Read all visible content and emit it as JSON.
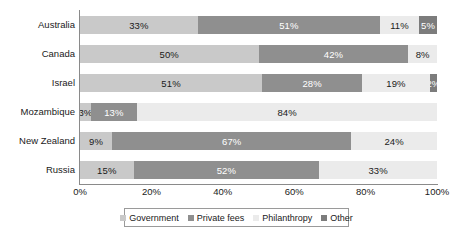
{
  "chart_data": {
    "type": "bar",
    "orientation": "horizontal",
    "stacked": true,
    "normalized": true,
    "title": "",
    "subtitle": "",
    "xlabel": "",
    "ylabel": "",
    "xlim": [
      0,
      100
    ],
    "xtick_labels": [
      "0%",
      "20%",
      "40%",
      "60%",
      "80%",
      "100%"
    ],
    "xtick_values": [
      0,
      20,
      40,
      60,
      80,
      100
    ],
    "grid": false,
    "legend_position": "bottom",
    "categories": [
      "Australia",
      "Canada",
      "Israel",
      "Mozambique",
      "New Zealand",
      "Russia"
    ],
    "series": [
      {
        "name": "Government",
        "color": "#c9c9c9",
        "values": [
          33,
          50,
          51,
          3,
          9,
          15
        ],
        "labels": [
          "33%",
          "50%",
          "51%",
          "3%",
          "9%",
          "15%"
        ]
      },
      {
        "name": "Private fees",
        "color": "#8f8f8f",
        "values": [
          51,
          42,
          28,
          13,
          67,
          52
        ],
        "labels": [
          "51%",
          "42%",
          "28%",
          "13%",
          "67%",
          "52%"
        ]
      },
      {
        "name": "Philanthropy",
        "color": "#ebebeb",
        "values": [
          11,
          8,
          19,
          84,
          24,
          33
        ],
        "labels": [
          "11%",
          "8%",
          "19%",
          "84%",
          "24%",
          "33%"
        ]
      },
      {
        "name": "Other",
        "color": "#7c7c7c",
        "values": [
          5,
          0,
          2,
          0,
          0,
          0
        ],
        "labels": [
          "5%",
          "",
          "2%",
          "",
          "",
          ""
        ]
      }
    ]
  },
  "legend": {
    "items": [
      {
        "label": "Government",
        "color": "#c9c9c9"
      },
      {
        "label": "Private fees",
        "color": "#8f8f8f"
      },
      {
        "label": "Philanthropy",
        "color": "#ebebeb"
      },
      {
        "label": "Other",
        "color": "#7c7c7c"
      }
    ]
  },
  "colors": {
    "government": "#c9c9c9",
    "private_fees": "#8f8f8f",
    "philanthropy": "#ebebeb",
    "other": "#7c7c7c",
    "axis": "#8a8a8a",
    "text": "#1a1a1a"
  }
}
